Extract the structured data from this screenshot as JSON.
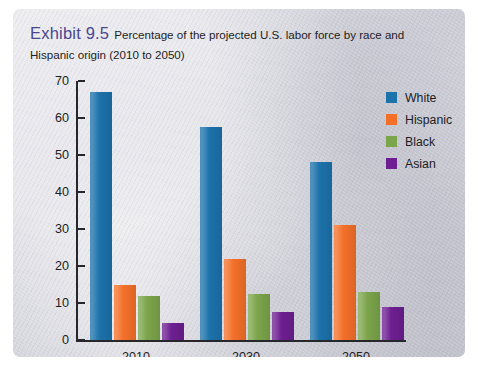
{
  "figure": {
    "exhibit_label": "Exhibit 9.5",
    "caption": "Percentage of the projected U.S. labor force by race and Hispanic origin (2010 to 2050)"
  },
  "chart_data": {
    "type": "bar",
    "title": "Percentage of the projected U.S. labor force by race and Hispanic origin (2010 to 2050)",
    "xlabel": "",
    "ylabel": "",
    "ylim": [
      0,
      70
    ],
    "yticks": [
      0,
      10,
      20,
      30,
      40,
      50,
      60,
      70
    ],
    "grid": false,
    "legend_position": "right",
    "categories": [
      "2010",
      "2030",
      "2050"
    ],
    "series": [
      {
        "name": "White",
        "color": "#1c72ab",
        "values": [
          67,
          57.5,
          48
        ]
      },
      {
        "name": "Hispanic",
        "color": "#f47029",
        "values": [
          15,
          22,
          31
        ]
      },
      {
        "name": "Black",
        "color": "#7ba54b",
        "values": [
          12,
          12.5,
          13
        ]
      },
      {
        "name": "Asian",
        "color": "#6d1f91",
        "values": [
          4.5,
          7.5,
          9
        ]
      }
    ]
  }
}
